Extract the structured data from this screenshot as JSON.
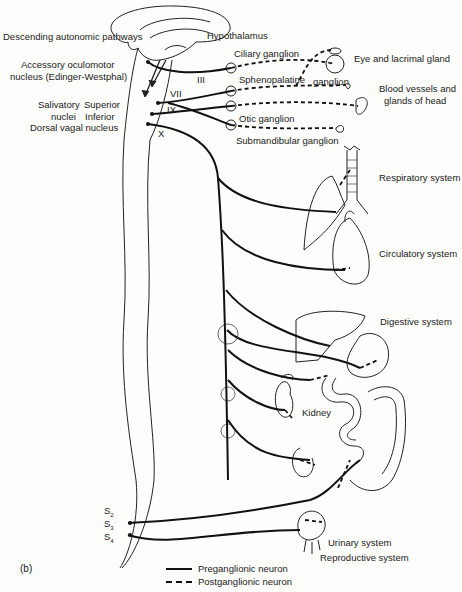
{
  "figure_label": "(b)",
  "brain_labels": {
    "descending": "Descending autonomic pathways",
    "hypothalamus": "Hypothalamus",
    "accessory_1": "Accessory oculomotor",
    "accessory_2": "nucleus (Edinger-Westphal)",
    "salivatory_1": "Salivatory",
    "salivatory_2": "nuclei",
    "superior": "Superior",
    "inferior": "Inferior",
    "dorsal_vagal": "Dorsal vagal nucleus"
  },
  "cranial_nerves": {
    "iii": "III",
    "vii": "VII",
    "ix": "IX",
    "x": "X"
  },
  "ganglia": {
    "ciliary": "Ciliary ganglion",
    "sphenopalatine": "Sphenopalatine",
    "sphenopalatine_2": "ganglion",
    "otic": "Otic ganglion",
    "submandibular": "Submandibular ganglion"
  },
  "targets": {
    "eye": "Eye and lacrimal gland",
    "blood_1": "Blood vessels and",
    "blood_2": "glands of head",
    "respiratory": "Respiratory system",
    "circulatory": "Circulatory system",
    "digestive": "Digestive system",
    "kidney": "Kidney",
    "urinary": "Urinary system",
    "reproductive": "Reproductive system"
  },
  "sacral": {
    "s2": "S",
    "s2_sub": "2",
    "s3": "S",
    "s3_sub": "3",
    "s4": "S",
    "s4_sub": "4"
  },
  "legend": {
    "preganglionic": "Preganglionic neuron",
    "postganglionic": "Postganglionic neuron"
  }
}
